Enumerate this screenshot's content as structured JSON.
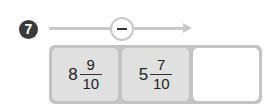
{
  "problem": {
    "number": "7",
    "operation": "minus",
    "operation_symbol": "−"
  },
  "cells": [
    {
      "whole": "8",
      "numerator": "9",
      "denominator": "10"
    },
    {
      "whole": "5",
      "numerator": "7",
      "denominator": "10"
    },
    {
      "answer": ""
    }
  ]
}
